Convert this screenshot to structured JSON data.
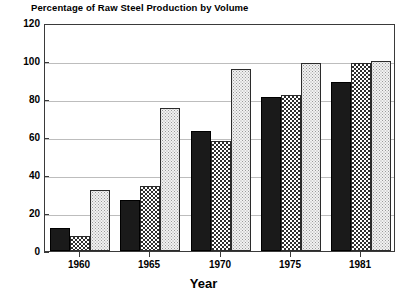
{
  "chart_data": {
    "type": "bar",
    "title": "Percentage of Raw Steel Production by Volume",
    "xlabel": "Year",
    "ylabel": "",
    "categories": [
      "1960",
      "1965",
      "1970",
      "1975",
      "1981"
    ],
    "series": [
      {
        "name": "series-1",
        "fill": "solid-black",
        "values": [
          12,
          27,
          63,
          81,
          89
        ]
      },
      {
        "name": "series-2",
        "fill": "cross-hatch",
        "values": [
          8,
          34,
          58,
          82,
          99
        ]
      },
      {
        "name": "series-3",
        "fill": "light-stipple",
        "values": [
          32,
          75,
          96,
          99,
          100
        ]
      }
    ],
    "ylim": [
      0,
      120
    ],
    "yticks": [
      0,
      20,
      40,
      60,
      80,
      100,
      120
    ],
    "ytick_labels": [
      "0",
      "20",
      "40",
      "60",
      "80",
      "100",
      "120"
    ],
    "grid": true,
    "legend": "none",
    "colors": {
      "axis": "#3a3a3a",
      "grid": "#bdbdbd",
      "text": "#000000",
      "series_1": "#1a1a1a",
      "series_2": "#2e2e2e",
      "series_3": "#f2f2f2",
      "background": "#ffffff"
    }
  }
}
